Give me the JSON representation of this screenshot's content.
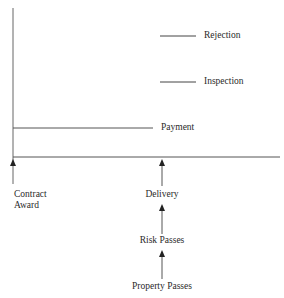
{
  "diagram": {
    "type": "timeline",
    "colors": {
      "line": "#555555",
      "text": "#2a2a2a",
      "background": "#ffffff"
    },
    "top_events": [
      {
        "label": "Rejection"
      },
      {
        "label": "Inspection"
      },
      {
        "label": "Payment"
      }
    ],
    "baseline_events": [
      {
        "label_line1": "Contract",
        "label_line2": "Award"
      },
      {
        "label": "Delivery"
      }
    ],
    "chain_below_delivery": [
      {
        "label": "Risk Passes"
      },
      {
        "label": "Property Passes"
      }
    ]
  }
}
